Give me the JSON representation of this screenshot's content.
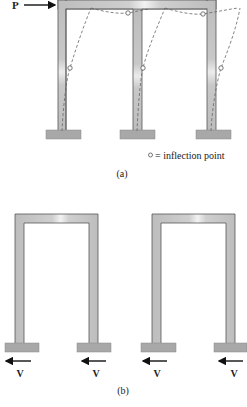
{
  "figure_a": {
    "caption": "(a)",
    "load_label": "P",
    "legend_symbol": "○",
    "legend_text": "= inflection point",
    "colors": {
      "member_fill": "#c4c4c4",
      "member_edge": "#555555",
      "deflected_line": "#666666",
      "base_fill": "#a8a8a8"
    }
  },
  "figure_b": {
    "caption": "(b)",
    "shear_labels": [
      "V",
      "V",
      "V",
      "V"
    ]
  }
}
